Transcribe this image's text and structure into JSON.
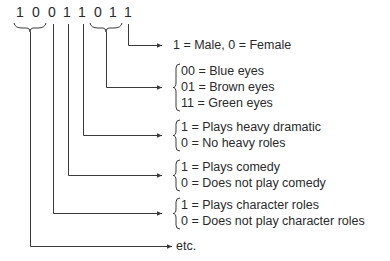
{
  "code": {
    "bits": [
      "1",
      "0",
      "0",
      "1",
      "1",
      "0",
      "1",
      "1"
    ]
  },
  "fields": [
    {
      "id": "sex",
      "lines": [
        "1 = Male, 0 = Female"
      ]
    },
    {
      "id": "eyes",
      "lines": [
        "00 = Blue eyes",
        "01 = Brown eyes",
        "11 = Green eyes"
      ]
    },
    {
      "id": "dramatic",
      "lines": [
        "1 = Plays heavy dramatic",
        "0 = No heavy roles"
      ]
    },
    {
      "id": "comedy",
      "lines": [
        "1 = Plays comedy",
        "0 = Does not play comedy"
      ]
    },
    {
      "id": "character",
      "lines": [
        "1 = Plays character roles",
        "0 = Does not play character roles"
      ]
    },
    {
      "id": "etc",
      "lines": [
        "etc."
      ]
    }
  ]
}
